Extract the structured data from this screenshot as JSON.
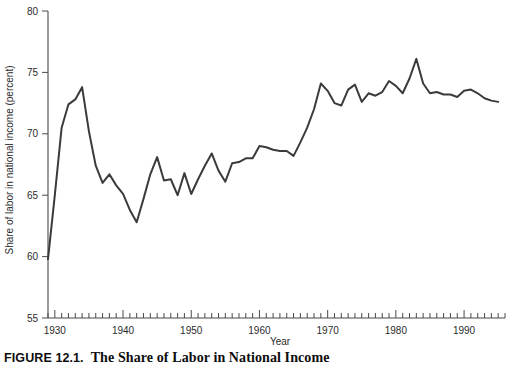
{
  "caption": {
    "label": "FIGURE 12.1.",
    "text": "The Share of Labor in National Income"
  },
  "chart_data": {
    "type": "line",
    "title": "",
    "xlabel": "Year",
    "ylabel": "Share of labor in national income (percent)",
    "xlim": [
      1929,
      1996
    ],
    "ylim": [
      55,
      80
    ],
    "grid": false,
    "legend": false,
    "y_ticks": [
      55,
      60,
      65,
      70,
      75,
      80
    ],
    "y_tick_labels": [
      "55",
      "60",
      "65",
      "70",
      "75",
      "80"
    ],
    "x_major_ticks": [
      1930,
      1940,
      1950,
      1960,
      1970,
      1980,
      1990
    ],
    "x_major_tick_labels": [
      "1930",
      "1940",
      "1950",
      "1960",
      "1970",
      "1980",
      "1990"
    ],
    "x_minor_tick_interval": 1,
    "line_color": "#3b3b3b",
    "axis_color": "#4a4a4a",
    "x": [
      1929,
      1930,
      1931,
      1932,
      1933,
      1934,
      1935,
      1936,
      1937,
      1938,
      1939,
      1940,
      1941,
      1942,
      1943,
      1944,
      1945,
      1946,
      1947,
      1948,
      1949,
      1950,
      1951,
      1952,
      1953,
      1954,
      1955,
      1956,
      1957,
      1958,
      1959,
      1960,
      1961,
      1962,
      1963,
      1964,
      1965,
      1966,
      1967,
      1968,
      1969,
      1970,
      1971,
      1972,
      1973,
      1974,
      1975,
      1976,
      1977,
      1978,
      1979,
      1980,
      1981,
      1982,
      1983,
      1984,
      1985,
      1986,
      1987,
      1988,
      1989,
      1990,
      1991,
      1992,
      1993,
      1994,
      1995
    ],
    "y": [
      59.8,
      65.0,
      70.5,
      72.4,
      72.8,
      73.8,
      70.2,
      67.4,
      66.0,
      66.7,
      65.8,
      65.1,
      63.8,
      62.8,
      64.7,
      66.7,
      68.1,
      66.2,
      66.3,
      65.0,
      66.8,
      65.1,
      66.3,
      67.4,
      68.4,
      67.0,
      66.1,
      67.6,
      67.7,
      68.0,
      68.0,
      69.0,
      68.9,
      68.7,
      68.6,
      68.6,
      68.2,
      69.3,
      70.5,
      72.0,
      74.1,
      73.5,
      72.5,
      72.3,
      73.6,
      74.0,
      72.6,
      73.3,
      73.1,
      73.4,
      74.3,
      73.9,
      73.3,
      74.5,
      76.1,
      74.1,
      73.3,
      73.4,
      73.2,
      73.2,
      73.0,
      73.5,
      73.6,
      73.3,
      72.9,
      72.7,
      72.6
    ]
  }
}
